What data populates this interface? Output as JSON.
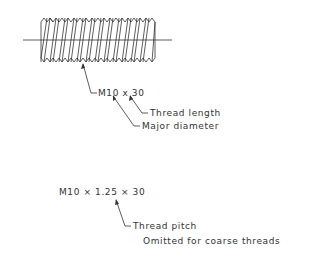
{
  "diagram": {
    "type": "thread callout drawing",
    "line_color": "#333333",
    "thread": {
      "crests": 13,
      "body": {
        "x1": 41,
        "x2": 155,
        "y_top": 18,
        "y_bottom": 62
      },
      "centerline": {
        "x1": 23,
        "x2": 172,
        "y": 40
      }
    },
    "callout1": {
      "designation": "M10 x 30",
      "length_label": "Thread length",
      "diameter_label": "Major diameter"
    },
    "callout2": {
      "designation": "M10 × 1.25 × 30",
      "pitch_label": "Thread pitch",
      "pitch_note": "Omitted for coarse threads"
    }
  }
}
